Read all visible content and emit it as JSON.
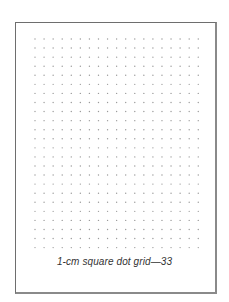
{
  "caption": "1-cm square dot grid—33",
  "grid": {
    "columns": 19,
    "rows": 24,
    "origin_x": 35,
    "origin_y": 39,
    "spacing": 9.07,
    "dot_color": "#9a9a9a",
    "dot_radius": 0.7
  },
  "colors": {
    "border": "#6e6e6e",
    "background": "#ffffff",
    "text": "#333333"
  }
}
